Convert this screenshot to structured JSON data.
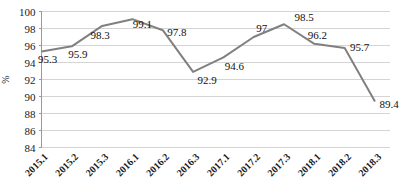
{
  "chart_data": {
    "type": "line",
    "title": "",
    "xlabel": "",
    "ylabel": "%",
    "ylim": [
      84,
      100
    ],
    "ytick_step": 2,
    "yticks": [
      100,
      98,
      96,
      94,
      92,
      90,
      88,
      86,
      84
    ],
    "grid": true,
    "legend": "none",
    "series_color": "#808080",
    "gridline_color": "#d4d4d4",
    "axis_color": "#9a9a9a",
    "categories": [
      "2015.1",
      "2015.2",
      "2015.3",
      "2016.1",
      "2016.2",
      "2016.3",
      "2017.1",
      "2017.2",
      "2017.3",
      "2018.1",
      "2018.2",
      "2018.3"
    ],
    "values": [
      95.3,
      95.9,
      98.3,
      99.1,
      97.8,
      92.9,
      94.6,
      97,
      98.5,
      96.2,
      95.7,
      89.4
    ],
    "data_labels": [
      "95.3",
      "95.9",
      "98.3",
      "99.1",
      "97.8",
      "92.9",
      "94.6",
      "97",
      "98.5",
      "96.2",
      "95.7",
      "89.4"
    ],
    "label_offsets": [
      {
        "dx": 6,
        "dy": 12
      },
      {
        "dx": 6,
        "dy": 12
      },
      {
        "dx": -2,
        "dy": 13
      },
      {
        "dx": 10,
        "dy": 9
      },
      {
        "dx": 14,
        "dy": 6
      },
      {
        "dx": 14,
        "dy": 12
      },
      {
        "dx": 11,
        "dy": 13
      },
      {
        "dx": 8,
        "dy": -5
      },
      {
        "dx": 20,
        "dy": -3
      },
      {
        "dx": 3,
        "dy": -5
      },
      {
        "dx": 15,
        "dy": 3
      },
      {
        "dx": 14,
        "dy": 6
      }
    ]
  }
}
